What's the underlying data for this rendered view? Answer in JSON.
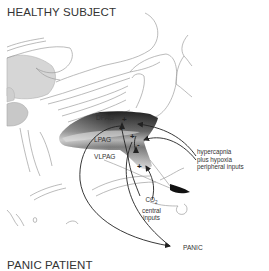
{
  "figure": {
    "panel_top_title": "HEALTHY SUBJECT",
    "panel_bottom_title": "PANIC PATIENT",
    "regions": {
      "dpag": "DPAG",
      "lpag": "LPAG",
      "vlpag": "VLPAG"
    },
    "signs": {
      "dpag_plus": "+",
      "dpag_minus": "-",
      "lpag_plus": "+",
      "lpag_minus": "-",
      "vlpag_plus": "+"
    },
    "inputs": {
      "peripheral": [
        "hypercapnia",
        "plus hypoxia",
        "peripheral inputs"
      ],
      "central_co2": "CO",
      "central_co2_sub": "2",
      "central": [
        "central",
        "inputs"
      ]
    },
    "output": "PANIC",
    "colors": {
      "outline": "#9a9a9a",
      "pag_dark": "#2a2a2a",
      "pag_light": "#d8d8d8",
      "gray_fill": "#cfcfcf",
      "arrow": "#222222",
      "text": "#333333"
    }
  }
}
